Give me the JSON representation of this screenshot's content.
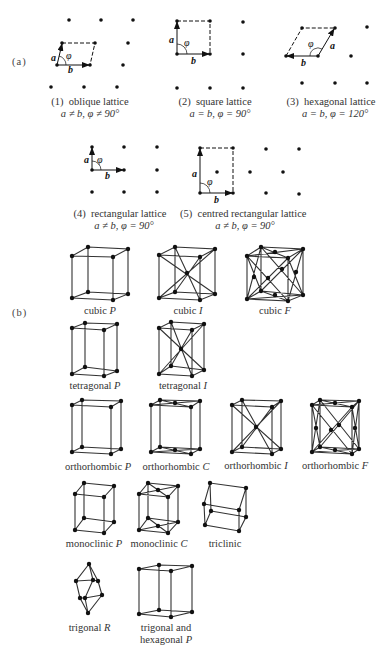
{
  "part_a": {
    "label": "(a)",
    "lattices": [
      {
        "number": "(1)",
        "name": "oblique lattice",
        "condition": "a ≠ b, φ ≠ 90°"
      },
      {
        "number": "(2)",
        "name": "square lattice",
        "condition": "a = b, φ = 90°"
      },
      {
        "number": "(3)",
        "name": "hexagonal lattice",
        "condition": "a = b, φ = 120°"
      },
      {
        "number": "(4)",
        "name": "rectangular lattice",
        "condition": "a ≠ b, φ = 90°"
      },
      {
        "number": "(5)",
        "name": "centred rectangular lattice",
        "condition": "a ≠ b, φ = 90°"
      }
    ],
    "vector_labels": {
      "a": "a",
      "b": "b",
      "angle": "φ"
    }
  },
  "part_b": {
    "label": "(b)",
    "bravais_lattices": [
      {
        "system": "cubic",
        "centering": "P"
      },
      {
        "system": "cubic",
        "centering": "I"
      },
      {
        "system": "cubic",
        "centering": "F"
      },
      {
        "system": "tetragonal",
        "centering": "P"
      },
      {
        "system": "tetragonal",
        "centering": "I"
      },
      {
        "system": "orthorhombic",
        "centering": "P"
      },
      {
        "system": "orthorhombic",
        "centering": "C"
      },
      {
        "system": "orthorhombic",
        "centering": "I"
      },
      {
        "system": "orthorhombic",
        "centering": "F"
      },
      {
        "system": "monoclinic",
        "centering": "P"
      },
      {
        "system": "monoclinic",
        "centering": "C"
      },
      {
        "system": "triclinic",
        "centering": ""
      },
      {
        "system": "trigonal",
        "centering": "R"
      },
      {
        "system": "trigonal and hexagonal",
        "centering": "P",
        "line1": "trigonal and",
        "line2": "hexagonal"
      }
    ]
  }
}
